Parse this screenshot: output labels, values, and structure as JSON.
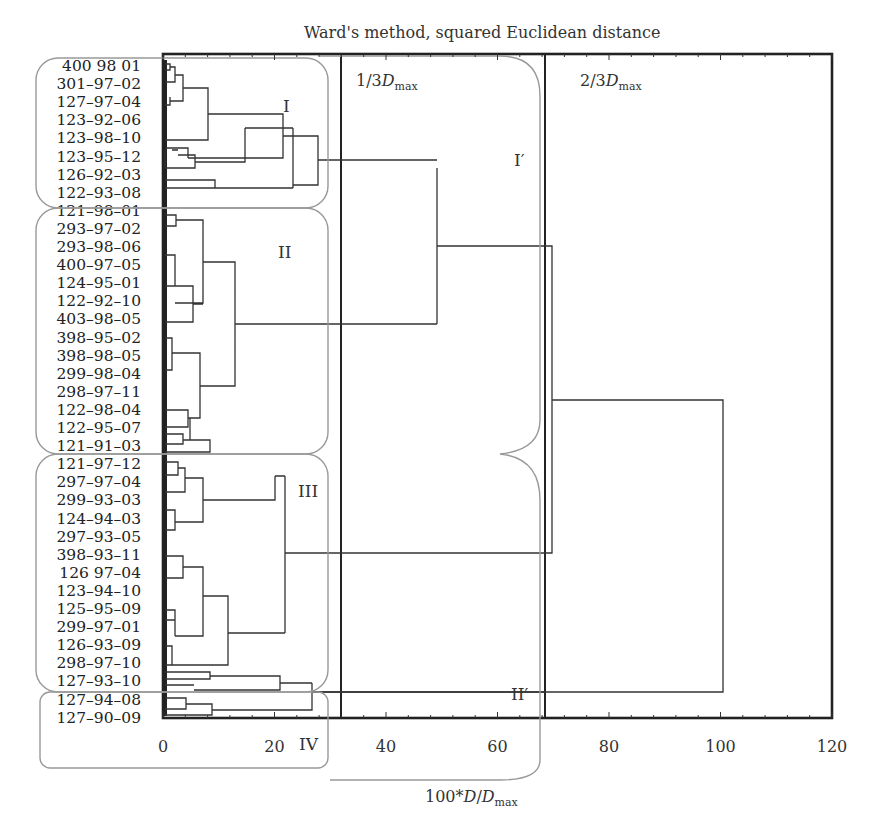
{
  "chart_data": {
    "type": "dendrogram",
    "title": "Ward's method, squared Euclidean distance",
    "xlabel": "100*D/Dmax",
    "xlim": [
      0,
      120
    ],
    "xticks": [
      0,
      20,
      40,
      60,
      80,
      100,
      120
    ],
    "orientation": "horizontal",
    "leaves": [
      "400 98 01",
      "301-97-02",
      "127-97-04",
      "123-92-06",
      "123-98-10",
      "123-95-12",
      "126-92-03",
      "122-93-08",
      "121-98-01",
      "293-97-02",
      "293-98-06",
      "400-97-05",
      "124-95-01",
      "122-92-10",
      "403-98-05",
      "398-95-02",
      "398-98-05",
      "299-98-04",
      "298-97-11",
      "122-98-04",
      "122-95-07",
      "121-91-03",
      "121-97-12",
      "297-97-04",
      "299-93-03",
      "124-94-03",
      "297-93-05",
      "398-93-11",
      "126 97-04",
      "123-94-10",
      "125-95-09",
      "299-97-01",
      "126-93-09",
      "298-97-10",
      "127-93-10",
      "127-94-08",
      "127-90-09"
    ],
    "thresholds": [
      {
        "label": "1/3D",
        "subscript": "max",
        "value": 33.3
      },
      {
        "label": "2/3D",
        "subscript": "max",
        "value": 66.7
      }
    ],
    "clusters": [
      {
        "name": "I",
        "leaves_from": "400 98 01",
        "leaves_to": "122-93-08"
      },
      {
        "name": "II",
        "leaves_from": "121-98-01",
        "leaves_to": "121-91-03"
      },
      {
        "name": "III",
        "leaves_from": "121-97-12",
        "leaves_to": "127-93-10"
      },
      {
        "name": "IV",
        "leaves_from": "127-94-08",
        "leaves_to": "127-90-09"
      }
    ],
    "super_clusters": [
      {
        "name": "I′",
        "contains": [
          "I",
          "II"
        ]
      },
      {
        "name": "II′",
        "contains": [
          "III",
          "IV"
        ]
      }
    ],
    "merges": [
      {
        "clusters": [
          "I",
          "II"
        ],
        "height": 49
      },
      {
        "clusters": [
          "I+II",
          "III"
        ],
        "height": 70
      },
      {
        "clusters": [
          "I+II+III",
          "IV"
        ],
        "height": 100
      },
      {
        "clusters": [
          "I (internal)"
        ],
        "height": 28
      },
      {
        "clusters": [
          "II (internal)"
        ],
        "height": 13
      },
      {
        "clusters": [
          "III (internal)"
        ],
        "height": 20
      },
      {
        "clusters": [
          "III+tail",
          "IV"
        ],
        "height": 27
      }
    ],
    "grid": false,
    "legend": null
  },
  "labels": {
    "title": "Ward's method, squared Euclidean distance",
    "xlabel_pre": "100*",
    "xlabel_d": "D",
    "xlabel_slash": "/",
    "xlabel_d2": "D",
    "xlabel_sub": "max",
    "thresh1_pre": "1/3",
    "thresh1_d": "D",
    "thresh1_sub": "max",
    "thresh2_pre": "2/3",
    "thresh2_d": "D",
    "thresh2_sub": "max",
    "cluster_I": "I",
    "cluster_II": "II",
    "cluster_III": "III",
    "cluster_IV": "IV",
    "super_I": "I′",
    "super_II": "II′"
  }
}
